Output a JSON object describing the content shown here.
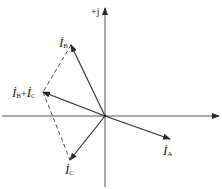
{
  "diagram": {
    "type": "phasor-diagram",
    "colors": {
      "line": "#2a2a2a",
      "axis": "#555555",
      "dashed": "#333333",
      "background": "#ffffff"
    },
    "axes": {
      "imaginary_label": "+j"
    },
    "phasors": [
      {
        "id": "IA",
        "symbol": "İ",
        "subscript": "A",
        "tip": [
          170,
          139
        ]
      },
      {
        "id": "IB",
        "symbol": "İ",
        "subscript": "B",
        "tip": [
          71,
          45
        ]
      },
      {
        "id": "IC",
        "symbol": "İ",
        "subscript": "C",
        "tip": [
          70,
          160
        ]
      },
      {
        "id": "IBC",
        "symbol": "İ",
        "subscript": "B",
        "plus": "+",
        "symbol2": "İ",
        "subscript2": "C",
        "tip": [
          43,
          92
        ]
      }
    ],
    "labels": {
      "ia": {
        "main": "İ",
        "sub": "A"
      },
      "ib": {
        "main": "İ",
        "sub": "B"
      },
      "ic": {
        "main": "İ",
        "sub": "C"
      },
      "ibc": {
        "main1": "İ",
        "sub1": "B",
        "plus": "+",
        "main2": "İ",
        "sub2": "C"
      }
    }
  }
}
